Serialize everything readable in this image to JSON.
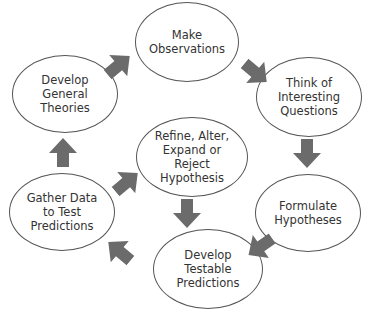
{
  "diagram": {
    "type": "cycle",
    "title": "",
    "colors": {
      "arrow": "#6b6b6b",
      "node_border": "#555555",
      "text": "#333333",
      "background": "#ffffff"
    },
    "nodes": [
      {
        "id": "observe",
        "label": "Make\nObservations"
      },
      {
        "id": "questions",
        "label": "Think of\nInteresting\nQuestions"
      },
      {
        "id": "hypotheses",
        "label": "Formulate\nHypotheses"
      },
      {
        "id": "predictions",
        "label": "Develop\nTestable\nPredictions"
      },
      {
        "id": "gather",
        "label": "Gather Data\nto Test\nPredictions"
      },
      {
        "id": "theories",
        "label": "Develop\nGeneral\nTheories"
      },
      {
        "id": "refine",
        "label": "Refine, Alter,\nExpand or\nReject\nHypothesis"
      }
    ],
    "edges": [
      {
        "from": "theories",
        "to": "observe"
      },
      {
        "from": "observe",
        "to": "questions"
      },
      {
        "from": "questions",
        "to": "hypotheses"
      },
      {
        "from": "hypotheses",
        "to": "predictions"
      },
      {
        "from": "predictions",
        "to": "gather"
      },
      {
        "from": "gather",
        "to": "theories"
      },
      {
        "from": "gather",
        "to": "refine"
      },
      {
        "from": "refine",
        "to": "predictions"
      }
    ]
  }
}
